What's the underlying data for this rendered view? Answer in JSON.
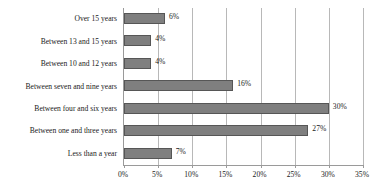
{
  "chart_data": {
    "type": "bar",
    "orientation": "horizontal",
    "title": "",
    "xlabel": "",
    "ylabel": "",
    "xlim": [
      0,
      35
    ],
    "ylim": null,
    "grid": true,
    "legend": false,
    "categories": [
      "Less than a year",
      "Between one and three years",
      "Between four and six years",
      "Between seven and nine years",
      "Between 10 and 12 years",
      "Between 13 and 15 years",
      "Over 15 years"
    ],
    "values": [
      7,
      27,
      30,
      16,
      4,
      4,
      6
    ],
    "data_labels": [
      "7%",
      "27%",
      "30%",
      "16%",
      "4%",
      "4%",
      "6%"
    ],
    "xticks": [
      0,
      5,
      10,
      15,
      20,
      25,
      30,
      35
    ],
    "xtick_labels": [
      "0%",
      "5%",
      "10%",
      "15%",
      "20%",
      "25%",
      "30%",
      "35%"
    ],
    "bar_color": "#7f7f7f",
    "bar_border_color": "#565656",
    "grid_color": "#b8b8b8",
    "axis_color": "#9a9a9a",
    "background": "#ffffff"
  },
  "rows": [
    {
      "label": "Over 15 years",
      "value": 6,
      "data_label": "6%"
    },
    {
      "label": "Between 13 and 15 years",
      "value": 4,
      "data_label": "4%"
    },
    {
      "label": "Between 10 and 12 years",
      "value": 4,
      "data_label": "4%"
    },
    {
      "label": "Between seven and nine years",
      "value": 16,
      "data_label": "16%"
    },
    {
      "label": "Between four and six years",
      "value": 30,
      "data_label": "30%"
    },
    {
      "label": "Between one and three years",
      "value": 27,
      "data_label": "27%"
    },
    {
      "label": "Less than a year",
      "value": 7,
      "data_label": "7%"
    }
  ],
  "xticks": [
    {
      "value": 0,
      "label": "0%"
    },
    {
      "value": 5,
      "label": "5%"
    },
    {
      "value": 10,
      "label": "10%"
    },
    {
      "value": 15,
      "label": "15%"
    },
    {
      "value": 20,
      "label": "20%"
    },
    {
      "value": 25,
      "label": "25%"
    },
    {
      "value": 30,
      "label": "30%"
    },
    {
      "value": 35,
      "label": "35%"
    }
  ]
}
